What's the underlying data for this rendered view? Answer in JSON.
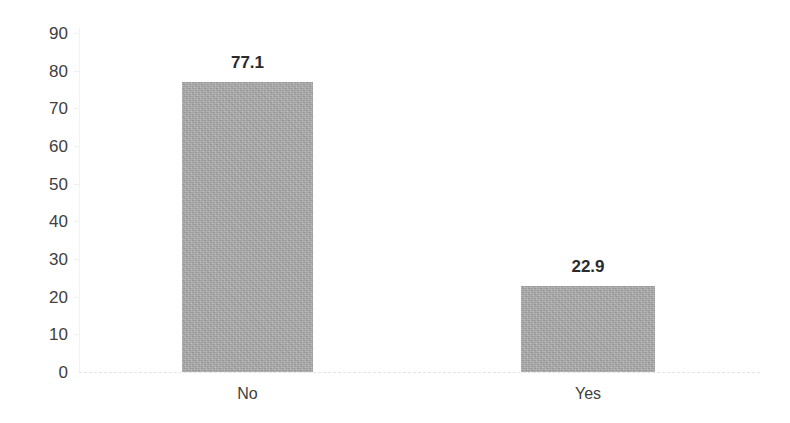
{
  "chart_data": {
    "type": "bar",
    "title": "",
    "subtitle": "",
    "xlabel": "",
    "ylabel": "",
    "categories": [
      "No",
      "Yes"
    ],
    "values": [
      77.1,
      22.9
    ],
    "value_labels": [
      "77.1",
      "22.9"
    ],
    "ylim": [
      0,
      90
    ],
    "y_ticks": [
      "0",
      "10",
      "20",
      "30",
      "40",
      "50",
      "60",
      "70",
      "80",
      "90"
    ],
    "y_tick_values": [
      0,
      10,
      20,
      30,
      40,
      50,
      60,
      70,
      80,
      90
    ],
    "grid": false,
    "legend": null,
    "legend_position": "none",
    "series": [
      {
        "name": "",
        "values": [
          77.1,
          22.9
        ]
      }
    ],
    "colors": {
      "bar_fill": "#a6a6a6",
      "axis_line": "#f2f2f2",
      "baseline": "#e3e3e3",
      "tick_text": "#404040",
      "value_text": "#2b2b2b",
      "background": "#ffffff"
    }
  }
}
